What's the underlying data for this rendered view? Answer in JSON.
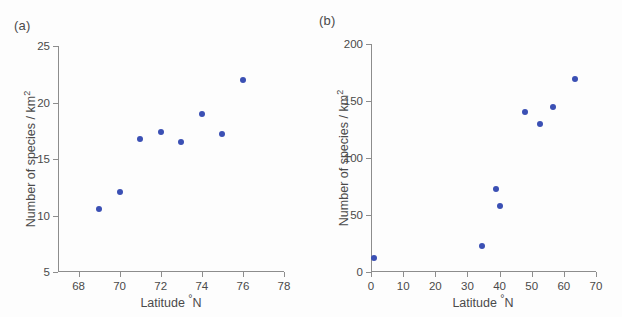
{
  "figure": {
    "background_color": "#fdfdfd",
    "marker_color": "#3b50b4",
    "axis_color": "#8d8d8d",
    "text_color": "#4a4a4a"
  },
  "panels": [
    {
      "key": "a",
      "label": "(a)",
      "xlabel_main": "Latitude ",
      "xlabel_degree": "°",
      "xlabel_tail": "N",
      "ylabel_main": "Number of species / km",
      "ylabel_sup": "2"
    },
    {
      "key": "b",
      "label": "(b)",
      "xlabel_main": "Latitude ",
      "xlabel_degree": "°",
      "xlabel_tail": "N",
      "ylabel_main": "Number of species / km",
      "ylabel_sup": "2"
    }
  ],
  "chart_data": [
    {
      "panel": "a",
      "type": "scatter",
      "title": "(a)",
      "xlabel": "Latitude °N",
      "ylabel": "Number of species / km²",
      "xlim": [
        67,
        78
      ],
      "ylim": [
        5,
        25
      ],
      "xticks": [
        68,
        70,
        72,
        74,
        76,
        78
      ],
      "yticks": [
        5,
        10,
        15,
        20,
        25
      ],
      "xtick_labels": [
        "68",
        "70",
        "72",
        "74",
        "76",
        "78"
      ],
      "ytick_labels": [
        "5",
        "10",
        "15",
        "20",
        "25"
      ],
      "grid": false,
      "legend": null,
      "marker_color": "#3b50b4",
      "x": [
        69.0,
        70.0,
        71.0,
        72.0,
        73.0,
        74.0,
        75.0,
        76.0
      ],
      "y": [
        10.6,
        12.1,
        16.8,
        17.4,
        16.5,
        19.0,
        17.2,
        22.0
      ],
      "points": [
        {
          "x": 69.0,
          "y": 10.6
        },
        {
          "x": 70.0,
          "y": 12.1
        },
        {
          "x": 71.0,
          "y": 16.8
        },
        {
          "x": 72.0,
          "y": 17.4
        },
        {
          "x": 73.0,
          "y": 16.5
        },
        {
          "x": 74.0,
          "y": 19.0
        },
        {
          "x": 75.0,
          "y": 17.2
        },
        {
          "x": 76.0,
          "y": 22.0
        }
      ]
    },
    {
      "panel": "b",
      "type": "scatter",
      "title": "(b)",
      "xlabel": "Latitude °N",
      "ylabel": "Number of species / km²",
      "xlim": [
        0,
        70
      ],
      "ylim": [
        0,
        200
      ],
      "xticks": [
        0,
        10,
        20,
        30,
        40,
        50,
        60,
        70
      ],
      "yticks": [
        0,
        50,
        100,
        150,
        200
      ],
      "xtick_labels": [
        "0",
        "10",
        "20",
        "30",
        "40",
        "50",
        "60",
        "70"
      ],
      "ytick_labels": [
        "0",
        "50",
        "100",
        "150",
        "200"
      ],
      "grid": false,
      "legend": null,
      "marker_color": "#3b50b4",
      "x": [
        1.0,
        34.5,
        39.0,
        40.0,
        48.0,
        52.5,
        56.5,
        63.5
      ],
      "y": [
        12,
        23,
        73,
        58,
        140,
        130,
        145,
        169
      ],
      "points": [
        {
          "x": 1.0,
          "y": 12
        },
        {
          "x": 34.5,
          "y": 23
        },
        {
          "x": 39.0,
          "y": 73
        },
        {
          "x": 40.0,
          "y": 58
        },
        {
          "x": 48.0,
          "y": 140
        },
        {
          "x": 52.5,
          "y": 130
        },
        {
          "x": 56.5,
          "y": 145
        },
        {
          "x": 63.5,
          "y": 169
        }
      ]
    }
  ]
}
